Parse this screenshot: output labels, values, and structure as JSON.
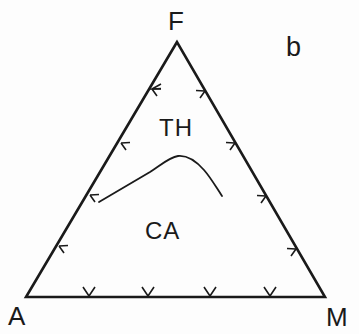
{
  "diagram": {
    "type": "ternary-diagram",
    "panel_label": "b",
    "vertices": {
      "top": "F",
      "bottom_left": "A",
      "bottom_right": "M"
    },
    "fields": [
      {
        "id": "th",
        "label": "TH"
      },
      {
        "id": "ca",
        "label": "CA"
      }
    ],
    "boundary_curve": "tholeiitic / calc-alkaline divide",
    "tick_arrows": {
      "left_side": 4,
      "right_side": 4,
      "bottom_side": 4,
      "direction": "outward"
    },
    "colors": {
      "line": "#1a1a1a",
      "background": "#fdfdfd"
    }
  }
}
